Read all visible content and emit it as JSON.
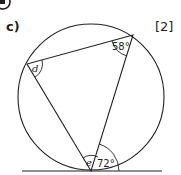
{
  "question": {
    "part_label": "c)",
    "marks": "[2]",
    "calculator_icon": "calculator-icon"
  },
  "diagram": {
    "circle": {
      "cx": 91,
      "cy": 97,
      "r": 73
    },
    "tangent_line": {
      "x1": 22,
      "y1": 171,
      "x2": 162,
      "y2": 171
    },
    "vertices": {
      "top_right": {
        "x": 133,
        "y": 35
      },
      "left": {
        "x": 27,
        "y": 64
      },
      "bottom": {
        "x": 91,
        "y": 171
      }
    },
    "angles": [
      {
        "label": "58°",
        "at": "top_right",
        "kind": "given"
      },
      {
        "label": "d",
        "at": "left",
        "kind": "unknown"
      },
      {
        "label": "e",
        "at": "bottom",
        "kind": "unknown"
      },
      {
        "label": "72°",
        "at": "bottom_tangent",
        "kind": "given"
      }
    ],
    "stroke_color": "#231f20"
  }
}
